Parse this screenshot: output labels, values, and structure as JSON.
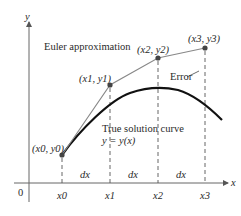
{
  "diagram": {
    "axes": {
      "x_label": "x",
      "y_label": "y",
      "origin_label": "0"
    },
    "labels": {
      "euler": "Euler approximation",
      "error": "Error",
      "true_curve_line1": "True solution curve",
      "true_curve_line2": "y = y(x)"
    },
    "points": [
      {
        "label": "(x0, y0)",
        "x_tick": "x0"
      },
      {
        "label": "(x1, y1)",
        "x_tick": "x1"
      },
      {
        "label": "(x2, y2)",
        "x_tick": "x2"
      },
      {
        "label": "(x3, y3)",
        "x_tick": "x3"
      }
    ],
    "intervals": [
      "dx",
      "dx",
      "dx"
    ],
    "colors": {
      "axis": "#555555",
      "euler_line": "#777777",
      "true_curve": "#111111",
      "points": "#444444"
    }
  }
}
